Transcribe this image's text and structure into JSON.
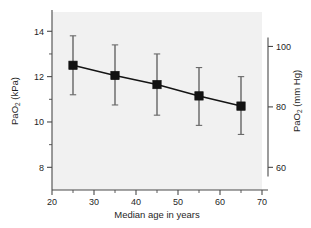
{
  "figure": {
    "background_color": "#ffffff",
    "plot_background_color": "#f1f1f1",
    "axis_color": "#4a4a4a",
    "series_color": "#121212"
  },
  "chart_data": {
    "type": "line",
    "title": "",
    "subtitle": "",
    "xlabel": "Median age in years",
    "ylabel": "PaO",
    "ylabel_sub": "2",
    "ylabel_unit": " (kPa)",
    "y2label": "PaO",
    "y2label_sub": "2",
    "y2label_unit": " (mm Hg)",
    "x": [
      25,
      35,
      45,
      55,
      65
    ],
    "values": [
      12.5,
      12.05,
      11.65,
      11.15,
      10.7
    ],
    "error_low": [
      11.2,
      10.75,
      10.3,
      9.85,
      9.45
    ],
    "error_high": [
      13.8,
      13.4,
      13.0,
      12.4,
      12.0
    ],
    "series": [
      {
        "name": "PaO2",
        "values": [
          12.5,
          12.05,
          11.65,
          11.15,
          10.7
        ],
        "error_low": [
          11.2,
          10.75,
          10.3,
          9.85,
          9.45
        ],
        "error_high": [
          13.8,
          13.4,
          13.0,
          12.4,
          12.0
        ]
      }
    ],
    "xlim": [
      20,
      70
    ],
    "ylim": [
      7.0,
      14.85
    ],
    "y2lim": [
      52.5,
      111.4
    ],
    "xticks": [
      20,
      30,
      40,
      50,
      60,
      70
    ],
    "xtick_labels": [
      "20",
      "30",
      "40",
      "50",
      "60",
      "70"
    ],
    "yticks": [
      8,
      10,
      12,
      14
    ],
    "ytick_labels": [
      "8",
      "10",
      "12",
      "14"
    ],
    "y2ticks": [
      60,
      80,
      100
    ],
    "y2tick_labels": [
      "60",
      "80",
      "100"
    ],
    "x_minor_ticks": [
      25,
      35,
      45,
      55,
      65
    ],
    "y_minor_ticks": [
      9,
      11,
      13
    ],
    "grid": false,
    "legend": null,
    "marker": "square",
    "errorbars": true
  }
}
